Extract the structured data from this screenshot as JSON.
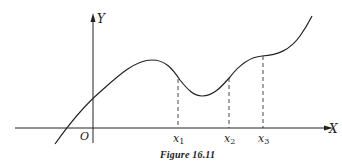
{
  "figure": {
    "caption": "Figure 16.11",
    "axes": {
      "x_label": "X",
      "y_label": "Y",
      "origin_label": "O"
    },
    "marked_points": [
      {
        "label": "x",
        "subscript": "1"
      },
      {
        "label": "x",
        "subscript": "2"
      },
      {
        "label": "x",
        "subscript": "3"
      }
    ]
  }
}
